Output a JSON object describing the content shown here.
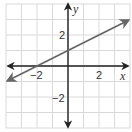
{
  "chart_data": {
    "type": "line",
    "title": "",
    "xlabel": "x",
    "ylabel": "y",
    "xlim": [
      -4,
      4
    ],
    "ylim": [
      -4,
      4
    ],
    "grid": true,
    "x_ticks_labeled": [
      -2,
      2
    ],
    "y_ticks_labeled": [
      -2,
      2
    ],
    "series": [
      {
        "name": "line",
        "equation": "y = 0.5x + 1",
        "x": [
          -4,
          -2,
          0,
          2,
          4
        ],
        "y": [
          -1,
          0,
          1,
          2,
          3
        ],
        "arrows_both_ends": true
      }
    ]
  },
  "labels": {
    "x_axis": "x",
    "y_axis": "y",
    "x_tick_neg2": "−2",
    "x_tick_2": "2",
    "y_tick_neg2": "−2",
    "y_tick_2": "2"
  },
  "colors": {
    "grid": "#d9d9d9",
    "axis": "#222222",
    "line": "#666666",
    "background": "#ffffff"
  }
}
